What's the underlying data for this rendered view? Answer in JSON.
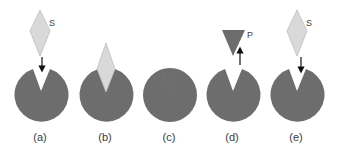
{
  "diagram": {
    "colors": {
      "enzyme": "#6d6d6d",
      "substrate_fill": "#d9d9d9",
      "substrate_stroke": "#bdbdbd",
      "product": "#6d6d6d",
      "arrow": "#111111",
      "label": "#3a3a3a"
    },
    "panels": [
      {
        "id": "a",
        "label": "(a)",
        "enzyme": "open",
        "substrate_label": "S",
        "arrow": "down"
      },
      {
        "id": "b",
        "label": "(b)",
        "enzyme": "bound",
        "substrate": "docked"
      },
      {
        "id": "c",
        "label": "(c)",
        "enzyme": "closed"
      },
      {
        "id": "d",
        "label": "(d)",
        "enzyme": "open",
        "product_label": "P",
        "arrow": "up"
      },
      {
        "id": "e",
        "label": "(e)",
        "enzyme": "open",
        "substrate_label": "S",
        "arrow": "down"
      }
    ]
  }
}
